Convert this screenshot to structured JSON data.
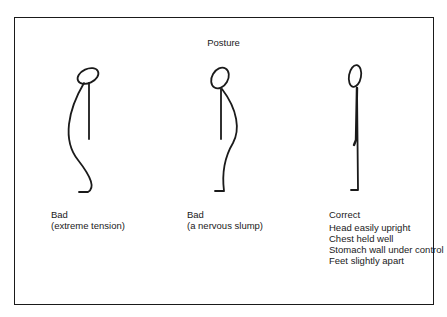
{
  "diagram": {
    "title": "Posture",
    "figures": [
      {
        "id": "extreme-tension",
        "heading": "Bad",
        "lines": [
          "(extreme tension)"
        ]
      },
      {
        "id": "nervous-slump",
        "heading": "Bad",
        "lines": [
          "(a nervous slump)"
        ]
      },
      {
        "id": "correct",
        "heading": "Correct",
        "lines": [
          "Head easily upright",
          "Chest held well",
          "Stomach wall under control",
          "Feet slightly apart"
        ]
      }
    ],
    "colors": {
      "ink": "#1a1a1a",
      "background": "#ffffff"
    }
  }
}
